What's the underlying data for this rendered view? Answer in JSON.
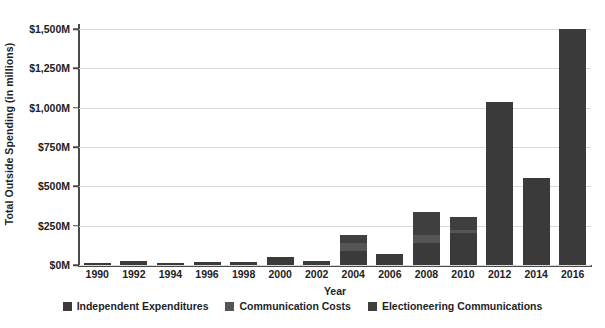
{
  "chart_data": {
    "type": "bar",
    "subtype": "stacked-vertical-bar",
    "title": "",
    "xlabel": "Year",
    "ylabel": "Total Outside Spending (in millions)",
    "categories": [
      "1990",
      "1992",
      "1994",
      "1996",
      "1998",
      "2000",
      "2002",
      "2004",
      "2006",
      "2008",
      "2010",
      "2012",
      "2014",
      "2016"
    ],
    "series": [
      {
        "name": "Independent Expenditures",
        "color": "#3a3a3a",
        "values": [
          12,
          25,
          12,
          22,
          17,
          52,
          26,
          87,
          67,
          143,
          205,
          1035,
          555,
          1500
        ]
      },
      {
        "name": "Communication Costs",
        "color": "#555555",
        "values": [
          0,
          0,
          0,
          0,
          0,
          0,
          0,
          50,
          0,
          47,
          18,
          0,
          0,
          0
        ]
      },
      {
        "name": "Electioneering Communications",
        "color": "#3f3f3f",
        "values": [
          0,
          0,
          0,
          0,
          0,
          0,
          0,
          55,
          0,
          148,
          84,
          0,
          0,
          0
        ]
      }
    ],
    "totals": [
      12,
      25,
      12,
      22,
      17,
      52,
      26,
      192,
      67,
      338,
      307,
      1035,
      555,
      1500
    ],
    "ylim": [
      0,
      1500
    ],
    "ytick_values": [
      0,
      250,
      500,
      750,
      1000,
      1250,
      1500
    ],
    "ytick_labels": [
      "$0M",
      "$250M",
      "$500M",
      "$750M",
      "$1,000M",
      "$1,250M",
      "$1,500M"
    ],
    "grid": true,
    "grid_axis": "y",
    "legend_position": "bottom",
    "legend_entries": [
      "Independent Expenditures",
      "Communication Costs",
      "Electioneering Communications"
    ],
    "background_color": "#ffffff",
    "axis_color": "#4a4a4a",
    "gridline_color": "#d9d9d9"
  }
}
